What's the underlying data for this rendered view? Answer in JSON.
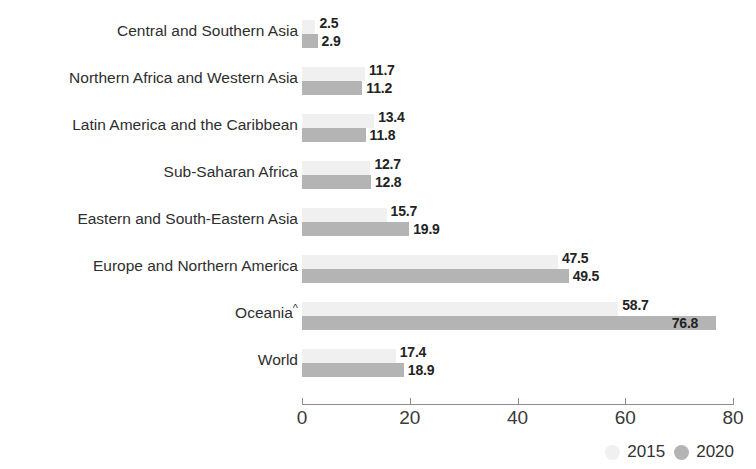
{
  "title_strip": "",
  "chart_data": {
    "type": "bar",
    "orientation": "horizontal",
    "title": "",
    "xlabel": "",
    "ylabel": "",
    "xlim": [
      0,
      80
    ],
    "xticks": [
      "0",
      "20",
      "40",
      "60",
      "80"
    ],
    "xtick_values": [
      0,
      20,
      40,
      60,
      80
    ],
    "grid": false,
    "legend_position": "bottom-right",
    "categories": [
      "Central and Southern Asia",
      "Northern Africa and Western Asia",
      "Latin America and the Caribbean",
      "Sub-Saharan Africa",
      "Eastern and South-Eastern Asia",
      "Europe and Northern America",
      "Oceania",
      "World"
    ],
    "category_superscripts": [
      "",
      "",
      "",
      "",
      "",
      "",
      "^",
      ""
    ],
    "series": [
      {
        "name": "2015",
        "color": "#f0f0f0",
        "values": [
          2.5,
          11.7,
          13.4,
          12.7,
          15.7,
          47.5,
          58.7,
          17.4
        ],
        "labels": [
          "2.5",
          "11.7",
          "13.4",
          "12.7",
          "15.7",
          "47.5",
          "58.7",
          "17.4"
        ]
      },
      {
        "name": "2020",
        "color": "#b4b4b4",
        "values": [
          2.9,
          11.2,
          11.8,
          12.8,
          19.9,
          49.5,
          76.8,
          18.9
        ],
        "labels": [
          "2.9",
          "11.2",
          "11.8",
          "12.8",
          "19.9",
          "49.5",
          "76.8",
          "18.9"
        ]
      }
    ]
  },
  "legend": {
    "items": [
      {
        "label": "2015",
        "color": "#f0f0f0"
      },
      {
        "label": "2020",
        "color": "#b4b4b4"
      }
    ]
  }
}
